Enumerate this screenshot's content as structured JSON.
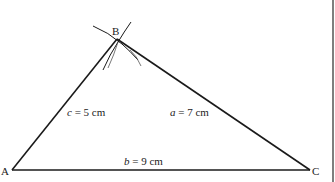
{
  "diagram": {
    "vertices": {
      "A": {
        "label": "A",
        "x": 12,
        "y": 170
      },
      "B": {
        "label": "B",
        "x": 117,
        "y": 39
      },
      "C": {
        "label": "C",
        "x": 310,
        "y": 170
      }
    },
    "sides": {
      "a": {
        "var": "a",
        "text": " = 7 cm"
      },
      "b": {
        "var": "b",
        "text": " = 9 cm"
      },
      "c": {
        "var": "c",
        "text": " = 5 cm"
      }
    },
    "colors": {
      "line": "#1a1a1a",
      "background": "#ffffff",
      "border": "#333333"
    }
  }
}
